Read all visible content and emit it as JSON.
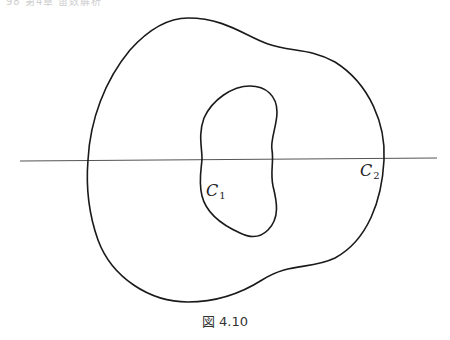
{
  "page_header": "98 第4章 留数解析",
  "figure": {
    "caption": "図 4.10",
    "labels": {
      "inner_curve": {
        "letter": "C",
        "subscript": "1"
      },
      "outer_curve": {
        "letter": "C",
        "subscript": "2"
      }
    },
    "stroke_color": "#1a1a1a",
    "line_color": "#555555"
  }
}
